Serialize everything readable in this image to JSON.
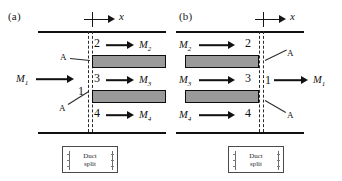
{
  "figure": {
    "caption_a": "(a)",
    "caption_b": "(b)",
    "axis_label": "x",
    "colors": {
      "plate_fill": "#9a9a9a",
      "line": "#111111",
      "dashed": "#2b2b2b"
    }
  },
  "panel_a": {
    "label": "(a)",
    "axis_label": "x",
    "inlet": {
      "mass_flow": "M",
      "subscript": "1"
    },
    "stations": [
      {
        "number": "1"
      },
      {
        "number": "2"
      },
      {
        "number": "3"
      },
      {
        "number": "4"
      }
    ],
    "flows": [
      {
        "mass_flow": "M",
        "subscript": "2",
        "station": "2"
      },
      {
        "mass_flow": "M",
        "subscript": "3",
        "station": "3"
      },
      {
        "mass_flow": "M",
        "subscript": "4",
        "station": "4"
      }
    ],
    "callouts": [
      {
        "label": "A"
      },
      {
        "label": "A"
      }
    ],
    "legend": {
      "line1": "Duct",
      "line2": "split"
    }
  },
  "panel_b": {
    "label": "(b)",
    "axis_label": "x",
    "outlet": {
      "mass_flow": "M",
      "subscript": "1"
    },
    "stations": [
      {
        "number": "2"
      },
      {
        "number": "3"
      },
      {
        "number": "4"
      },
      {
        "number": "1"
      }
    ],
    "flows": [
      {
        "mass_flow": "M",
        "subscript": "2",
        "station": "2"
      },
      {
        "mass_flow": "M",
        "subscript": "3",
        "station": "3"
      },
      {
        "mass_flow": "M",
        "subscript": "4",
        "station": "4"
      }
    ],
    "callouts": [
      {
        "label": "A"
      },
      {
        "label": "A"
      }
    ],
    "legend": {
      "line1": "Duct",
      "line2": "split"
    }
  }
}
